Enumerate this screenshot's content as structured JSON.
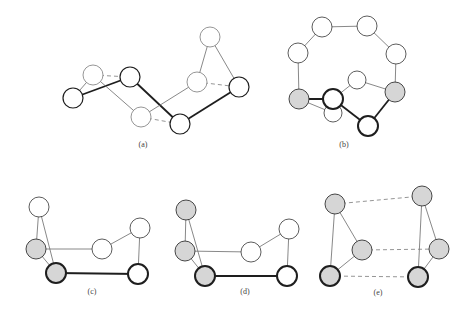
{
  "figure": {
    "colors": {
      "light_stroke": "#8a8a8a",
      "dark_stroke": "#1e1e1e",
      "gray_fill": "#d6d6d6",
      "white_fill": "#ffffff",
      "thin_edge": "#6a6a6a",
      "thick_edge": "#1e1e1e",
      "dashed_edge": "#7a7a7a"
    },
    "panels": [
      {
        "id": "a",
        "label": "(a)",
        "label_pos": [
          143,
          147
        ],
        "nodes": [
          {
            "id": "a1",
            "x": 93,
            "y": 75,
            "r": 10,
            "style": "light"
          },
          {
            "id": "a2",
            "x": 130,
            "y": 77,
            "r": 10,
            "style": "dark"
          },
          {
            "id": "a3",
            "x": 73,
            "y": 98,
            "r": 10,
            "style": "dark"
          },
          {
            "id": "a4",
            "x": 141,
            "y": 117,
            "r": 10,
            "style": "light"
          },
          {
            "id": "a5",
            "x": 180,
            "y": 124,
            "r": 10,
            "style": "dark"
          },
          {
            "id": "a6",
            "x": 197,
            "y": 82,
            "r": 10,
            "style": "light"
          },
          {
            "id": "a7",
            "x": 210,
            "y": 37,
            "r": 10,
            "style": "light"
          },
          {
            "id": "a8",
            "x": 239,
            "y": 87,
            "r": 10,
            "style": "dark"
          }
        ],
        "edges": [
          {
            "from": "a3",
            "to": "a2",
            "type": "thick"
          },
          {
            "from": "a2",
            "to": "a5",
            "type": "thick"
          },
          {
            "from": "a5",
            "to": "a8",
            "type": "thick"
          },
          {
            "from": "a3",
            "to": "a1",
            "type": "thin"
          },
          {
            "from": "a1",
            "to": "a4",
            "type": "thin"
          },
          {
            "from": "a4",
            "to": "a6",
            "type": "thin"
          },
          {
            "from": "a6",
            "to": "a7",
            "type": "thin"
          },
          {
            "from": "a7",
            "to": "a8",
            "type": "thin"
          },
          {
            "from": "a1",
            "to": "a2",
            "type": "dashed"
          },
          {
            "from": "a4",
            "to": "a5",
            "type": "dashed"
          },
          {
            "from": "a6",
            "to": "a8",
            "type": "dashed"
          }
        ]
      },
      {
        "id": "b",
        "label": "(b)",
        "label_pos": [
          344,
          147
        ],
        "nodes": [
          {
            "id": "b1",
            "x": 322,
            "y": 27,
            "r": 10,
            "style": "white"
          },
          {
            "id": "b2",
            "x": 367,
            "y": 26,
            "r": 10,
            "style": "white"
          },
          {
            "id": "b3",
            "x": 298,
            "y": 53,
            "r": 10,
            "style": "white"
          },
          {
            "id": "b4",
            "x": 396,
            "y": 54,
            "r": 10,
            "style": "white"
          },
          {
            "id": "b5",
            "x": 357,
            "y": 80,
            "r": 9,
            "style": "white"
          },
          {
            "id": "b6",
            "x": 299,
            "y": 99,
            "r": 10,
            "style": "gray"
          },
          {
            "id": "b7",
            "x": 333,
            "y": 113,
            "r": 9,
            "style": "white"
          },
          {
            "id": "b8",
            "x": 333,
            "y": 99,
            "r": 10,
            "style": "darkwhite"
          },
          {
            "id": "b9",
            "x": 395,
            "y": 92,
            "r": 10,
            "style": "gray"
          },
          {
            "id": "b10",
            "x": 368,
            "y": 126,
            "r": 10,
            "style": "darkwhite"
          }
        ],
        "edges": [
          {
            "from": "b1",
            "to": "b2",
            "type": "thin"
          },
          {
            "from": "b1",
            "to": "b3",
            "type": "thin"
          },
          {
            "from": "b2",
            "to": "b4",
            "type": "thin"
          },
          {
            "from": "b3",
            "to": "b6",
            "type": "thin"
          },
          {
            "from": "b4",
            "to": "b9",
            "type": "thin"
          },
          {
            "from": "b5",
            "to": "b9",
            "type": "thin"
          },
          {
            "from": "b5",
            "to": "b8",
            "type": "thin"
          },
          {
            "from": "b6",
            "to": "b7",
            "type": "thin"
          },
          {
            "from": "b6",
            "to": "b8",
            "type": "thick"
          },
          {
            "from": "b8",
            "to": "b10",
            "type": "thick"
          },
          {
            "from": "b10",
            "to": "b9",
            "type": "thick"
          }
        ]
      },
      {
        "id": "c",
        "label": "(c)",
        "label_pos": [
          92,
          294
        ],
        "nodes": [
          {
            "id": "c1",
            "x": 39,
            "y": 207,
            "r": 10,
            "style": "white"
          },
          {
            "id": "c2",
            "x": 36,
            "y": 249,
            "r": 10,
            "style": "gray"
          },
          {
            "id": "c3",
            "x": 56,
            "y": 273,
            "r": 10,
            "style": "graydark"
          },
          {
            "id": "c4",
            "x": 102,
            "y": 249,
            "r": 10,
            "style": "white"
          },
          {
            "id": "c5",
            "x": 140,
            "y": 228,
            "r": 10,
            "style": "white"
          },
          {
            "id": "c6",
            "x": 138,
            "y": 274,
            "r": 10,
            "style": "darkwhite"
          }
        ],
        "edges": [
          {
            "from": "c1",
            "to": "c2",
            "type": "thin"
          },
          {
            "from": "c1",
            "to": "c3",
            "type": "thin"
          },
          {
            "from": "c2",
            "to": "c3",
            "type": "thin"
          },
          {
            "from": "c2",
            "to": "c4",
            "type": "thin"
          },
          {
            "from": "c4",
            "to": "c5",
            "type": "thin"
          },
          {
            "from": "c5",
            "to": "c6",
            "type": "thin"
          },
          {
            "from": "c3",
            "to": "c6",
            "type": "thick"
          }
        ]
      },
      {
        "id": "d",
        "label": "(d)",
        "label_pos": [
          245,
          294
        ],
        "nodes": [
          {
            "id": "d1",
            "x": 186,
            "y": 210,
            "r": 10,
            "style": "gray"
          },
          {
            "id": "d2",
            "x": 185,
            "y": 251,
            "r": 10,
            "style": "gray"
          },
          {
            "id": "d3",
            "x": 205,
            "y": 276,
            "r": 10,
            "style": "graydark"
          },
          {
            "id": "d4",
            "x": 251,
            "y": 252,
            "r": 10,
            "style": "white"
          },
          {
            "id": "d5",
            "x": 289,
            "y": 229,
            "r": 10,
            "style": "white"
          },
          {
            "id": "d6",
            "x": 287,
            "y": 276,
            "r": 10,
            "style": "darkwhite"
          }
        ],
        "edges": [
          {
            "from": "d1",
            "to": "d2",
            "type": "thin"
          },
          {
            "from": "d1",
            "to": "d3",
            "type": "thin"
          },
          {
            "from": "d2",
            "to": "d3",
            "type": "thin"
          },
          {
            "from": "d2",
            "to": "d4",
            "type": "thin"
          },
          {
            "from": "d4",
            "to": "d5",
            "type": "thin"
          },
          {
            "from": "d5",
            "to": "d6",
            "type": "thin"
          },
          {
            "from": "d3",
            "to": "d6",
            "type": "thick"
          }
        ]
      },
      {
        "id": "e",
        "label": "(e)",
        "label_pos": [
          378,
          295
        ],
        "nodes": [
          {
            "id": "e1",
            "x": 335,
            "y": 204,
            "r": 10,
            "style": "gray"
          },
          {
            "id": "e2",
            "x": 362,
            "y": 250,
            "r": 10,
            "style": "gray"
          },
          {
            "id": "e3",
            "x": 330,
            "y": 276,
            "r": 10,
            "style": "graydark"
          },
          {
            "id": "e4",
            "x": 422,
            "y": 196,
            "r": 10,
            "style": "gray"
          },
          {
            "id": "e5",
            "x": 439,
            "y": 249,
            "r": 10,
            "style": "gray"
          },
          {
            "id": "e6",
            "x": 418,
            "y": 277,
            "r": 10,
            "style": "graydark"
          }
        ],
        "edges": [
          {
            "from": "e1",
            "to": "e2",
            "type": "thin"
          },
          {
            "from": "e1",
            "to": "e3",
            "type": "thin"
          },
          {
            "from": "e2",
            "to": "e3",
            "type": "thin"
          },
          {
            "from": "e4",
            "to": "e5",
            "type": "thin"
          },
          {
            "from": "e4",
            "to": "e6",
            "type": "thin"
          },
          {
            "from": "e5",
            "to": "e6",
            "type": "thin"
          },
          {
            "from": "e1",
            "to": "e4",
            "type": "dashed"
          },
          {
            "from": "e2",
            "to": "e5",
            "type": "dashed"
          },
          {
            "from": "e3",
            "to": "e6",
            "type": "dashed"
          }
        ]
      }
    ]
  }
}
